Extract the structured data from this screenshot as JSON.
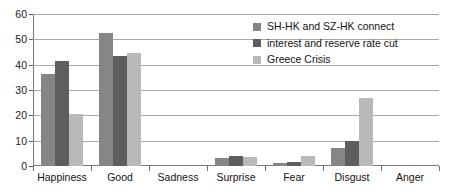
{
  "chart_data": {
    "type": "bar",
    "title": "",
    "xlabel": "",
    "ylabel": "",
    "ylim": [
      0,
      60
    ],
    "ytick_step": 10,
    "yticks": [
      0,
      10,
      20,
      30,
      40,
      50,
      60
    ],
    "grid": true,
    "legend_position": "upper-right",
    "categories": [
      "Happiness",
      "Good",
      "Sadness",
      "Surprise",
      "Fear",
      "Disgust",
      "Anger"
    ],
    "series": [
      {
        "name": "SH-HK and SZ-HK connect",
        "color": "#868686",
        "values": [
          36.5,
          52.5,
          0,
          3,
          1,
          7,
          0
        ]
      },
      {
        "name": "interest and reserve rate cut",
        "color": "#5e5e5e",
        "values": [
          41.5,
          43.5,
          0,
          4,
          1.5,
          10,
          0
        ]
      },
      {
        "name": "Greece Crisis",
        "color": "#b9b9b9",
        "values": [
          20.5,
          44.5,
          0,
          3.5,
          4,
          27,
          0
        ]
      }
    ]
  },
  "axis": {
    "ytick_labels": [
      "60",
      "50",
      "40",
      "30",
      "20",
      "10",
      "0"
    ]
  },
  "legend": {
    "items": [
      {
        "label": "SH-HK and SZ-HK connect"
      },
      {
        "label": "interest and reserve rate cut"
      },
      {
        "label": "Greece Crisis"
      }
    ]
  }
}
